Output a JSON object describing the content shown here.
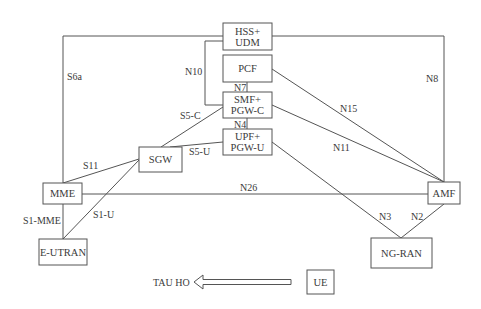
{
  "diagram": {
    "type": "network-architecture",
    "nodes": {
      "hss": {
        "line1": "HSS+",
        "line2": "UDM"
      },
      "pcf": {
        "label": "PCF"
      },
      "smf": {
        "line1": "SMF+",
        "line2": "PGW-C"
      },
      "upf": {
        "line1": "UPF+",
        "line2": "PGW-U"
      },
      "sgw": {
        "label": "SGW"
      },
      "mme": {
        "label": "MME"
      },
      "eutran": {
        "label": "E-UTRAN"
      },
      "amf": {
        "label": "AMF"
      },
      "ngran": {
        "label": "NG-RAN"
      },
      "ue": {
        "label": "UE"
      }
    },
    "interfaces": {
      "s6a": "S6a",
      "n10": "N10",
      "n7": "N7",
      "n4": "N4",
      "s5c": "S5-C",
      "s5u": "S5-U",
      "s11": "S11",
      "s1mme": "S1-MME",
      "s1u": "S1-U",
      "n26": "N26",
      "n8": "N8",
      "n15": "N15",
      "n11": "N11",
      "n3": "N3",
      "n2": "N2"
    },
    "arrow": {
      "label": "TAU HO",
      "direction": "left"
    },
    "colors": {
      "stroke": "#555555",
      "text": "#3a3a3a",
      "background": "#ffffff"
    }
  }
}
